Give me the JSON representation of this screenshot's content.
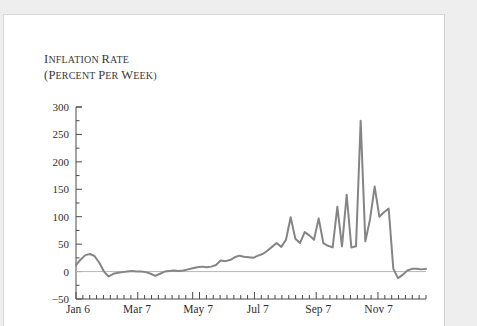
{
  "figure": {
    "title_line1": "Inflation rate",
    "title_line2": "(percent per week)",
    "line_color": "#858585",
    "axis_color": "#4a4a4a",
    "zero_line_color": "#b8b8b8",
    "background": "#ffffff",
    "page_background": "#eeeeee"
  },
  "chart_data": {
    "type": "line",
    "title": "Inflation rate (percent per week)",
    "xlabel": "",
    "ylabel": "Inflation rate (percent per week)",
    "ylim": [
      -50,
      300
    ],
    "xlim": [
      0,
      51
    ],
    "grid": false,
    "legend": null,
    "yticks": [
      -50,
      0,
      50,
      100,
      150,
      200,
      250,
      300
    ],
    "ytick_labels": [
      "-50",
      "0",
      "50",
      "100",
      "150",
      "200",
      "250",
      "300"
    ],
    "y_minor_tick_step": 25,
    "xtick_labels": [
      "Jan 6",
      "Mar 7",
      "May 7",
      "Jul 7",
      "Sep 7",
      "Nov 7"
    ],
    "xtick_indices": [
      0,
      8.6,
      17.5,
      26.2,
      35.0,
      43.8
    ],
    "x_minor_tick_step": 1,
    "series": [
      {
        "name": "Inflation rate",
        "x": [
          0,
          1,
          2,
          3,
          4,
          5,
          6,
          7,
          8,
          9,
          10,
          11,
          12,
          13,
          14,
          15,
          16,
          17,
          18,
          19,
          20,
          21,
          22,
          23,
          24,
          25,
          26,
          27,
          28,
          29,
          30,
          31,
          32,
          33,
          34,
          35,
          36,
          37,
          38,
          39,
          40,
          41,
          42,
          43,
          44,
          45,
          46,
          47,
          48,
          49,
          50,
          51
        ],
        "values": [
          12,
          20,
          28,
          32,
          30,
          20,
          5,
          -8,
          -3,
          -2,
          -1,
          0,
          1,
          0,
          0,
          -1,
          -4,
          -7,
          -3,
          0,
          1,
          2,
          1,
          2,
          4,
          7,
          10,
          12,
          11,
          10,
          13,
          22,
          20,
          22,
          27,
          30,
          28,
          27,
          26,
          30,
          33,
          40,
          48,
          55,
          47,
          60,
          100,
          62,
          55,
          75,
          70,
          62
        ]
      }
    ],
    "series_continued_note": "weekly observations spanning Jan 6 through late Dec"
  },
  "chart_points": {
    "x": [
      0,
      1,
      2,
      3,
      4,
      5,
      6,
      7,
      8,
      9,
      10,
      11,
      12,
      13,
      14,
      15,
      16,
      17,
      18,
      19,
      20,
      21,
      22,
      23,
      24,
      25,
      26,
      27,
      28,
      29,
      30,
      31,
      32,
      33,
      34,
      35,
      36,
      37,
      38,
      39,
      40,
      41,
      42,
      43,
      44,
      45,
      46,
      47,
      48,
      49,
      50,
      51,
      52,
      53,
      54,
      55,
      56,
      57,
      58,
      59,
      60
    ],
    "y": [
      12,
      22,
      30,
      32,
      28,
      16,
      0,
      -9,
      -4,
      -2,
      -1,
      0,
      1,
      0,
      0,
      -1,
      -4,
      -8,
      -4,
      0,
      1,
      2,
      1,
      2,
      4,
      6,
      8,
      9,
      8,
      9,
      12,
      20,
      19,
      21,
      26,
      29,
      27,
      26,
      25,
      29,
      32,
      38,
      45,
      52,
      45,
      58,
      99,
      60,
      52,
      72,
      66,
      58,
      97,
      52,
      47,
      44,
      118,
      46,
      140,
      44,
      46
    ]
  },
  "chart_points_tail": {
    "y_tail": [
      275,
      55,
      95,
      155,
      100,
      108,
      115,
      5,
      -12,
      -6,
      2,
      5,
      5,
      4,
      5
    ]
  }
}
